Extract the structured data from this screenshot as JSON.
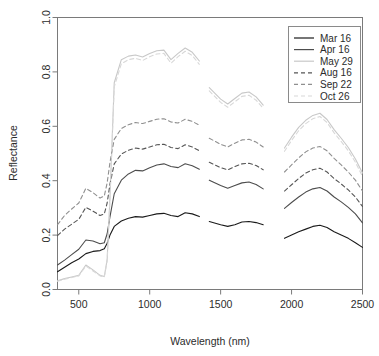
{
  "chart_data": {
    "type": "line",
    "title": "",
    "xlabel": "Wavelength (nm)",
    "ylabel": "Reflectance",
    "xlim": [
      350,
      2500
    ],
    "ylim": [
      0.0,
      1.0
    ],
    "xticks": [
      500,
      1000,
      1500,
      2000,
      2500
    ],
    "yticks": [
      "0.0",
      "0.2",
      "0.4",
      "0.6",
      "0.8",
      "1.0"
    ],
    "grid": false,
    "legend_position": "top-right",
    "gaps": [
      [
        1350,
        1420
      ],
      [
        1800,
        1950
      ]
    ],
    "series": [
      {
        "name": "Mar 16",
        "color": "#1a1a1a",
        "dash": "none",
        "points": [
          [
            350,
            0.065
          ],
          [
            400,
            0.082
          ],
          [
            450,
            0.098
          ],
          [
            500,
            0.112
          ],
          [
            550,
            0.132
          ],
          [
            600,
            0.14
          ],
          [
            650,
            0.143
          ],
          [
            680,
            0.15
          ],
          [
            700,
            0.17
          ],
          [
            720,
            0.2
          ],
          [
            750,
            0.232
          ],
          [
            800,
            0.252
          ],
          [
            850,
            0.262
          ],
          [
            900,
            0.268
          ],
          [
            950,
            0.266
          ],
          [
            1000,
            0.272
          ],
          [
            1050,
            0.278
          ],
          [
            1100,
            0.28
          ],
          [
            1150,
            0.272
          ],
          [
            1200,
            0.268
          ],
          [
            1250,
            0.282
          ],
          [
            1300,
            0.278
          ],
          [
            1350,
            0.268
          ],
          [
            1420,
            0.25
          ],
          [
            1500,
            0.238
          ],
          [
            1550,
            0.232
          ],
          [
            1600,
            0.238
          ],
          [
            1650,
            0.248
          ],
          [
            1700,
            0.25
          ],
          [
            1750,
            0.246
          ],
          [
            1800,
            0.238
          ],
          [
            1950,
            0.188
          ],
          [
            2000,
            0.2
          ],
          [
            2050,
            0.212
          ],
          [
            2100,
            0.222
          ],
          [
            2150,
            0.232
          ],
          [
            2200,
            0.236
          ],
          [
            2250,
            0.228
          ],
          [
            2300,
            0.212
          ],
          [
            2350,
            0.2
          ],
          [
            2400,
            0.188
          ],
          [
            2450,
            0.172
          ],
          [
            2500,
            0.155
          ]
        ]
      },
      {
        "name": "Apr 16",
        "color": "#4d4d4d",
        "dash": "none",
        "points": [
          [
            350,
            0.09
          ],
          [
            400,
            0.108
          ],
          [
            450,
            0.128
          ],
          [
            500,
            0.148
          ],
          [
            550,
            0.182
          ],
          [
            600,
            0.178
          ],
          [
            650,
            0.168
          ],
          [
            680,
            0.172
          ],
          [
            700,
            0.205
          ],
          [
            720,
            0.268
          ],
          [
            750,
            0.352
          ],
          [
            800,
            0.402
          ],
          [
            850,
            0.425
          ],
          [
            900,
            0.438
          ],
          [
            950,
            0.436
          ],
          [
            1000,
            0.448
          ],
          [
            1050,
            0.458
          ],
          [
            1100,
            0.462
          ],
          [
            1150,
            0.452
          ],
          [
            1200,
            0.448
          ],
          [
            1250,
            0.462
          ],
          [
            1300,
            0.455
          ],
          [
            1350,
            0.442
          ],
          [
            1420,
            0.402
          ],
          [
            1500,
            0.382
          ],
          [
            1550,
            0.372
          ],
          [
            1600,
            0.382
          ],
          [
            1650,
            0.392
          ],
          [
            1700,
            0.395
          ],
          [
            1750,
            0.386
          ],
          [
            1800,
            0.37
          ],
          [
            1950,
            0.298
          ],
          [
            2000,
            0.32
          ],
          [
            2050,
            0.34
          ],
          [
            2100,
            0.358
          ],
          [
            2150,
            0.37
          ],
          [
            2200,
            0.375
          ],
          [
            2250,
            0.362
          ],
          [
            2300,
            0.34
          ],
          [
            2350,
            0.322
          ],
          [
            2400,
            0.302
          ],
          [
            2450,
            0.278
          ],
          [
            2500,
            0.245
          ]
        ]
      },
      {
        "name": "May 29",
        "color": "#c8c8c8",
        "dash": "none",
        "points": [
          [
            350,
            0.032
          ],
          [
            400,
            0.04
          ],
          [
            450,
            0.046
          ],
          [
            500,
            0.052
          ],
          [
            550,
            0.09
          ],
          [
            600,
            0.072
          ],
          [
            650,
            0.052
          ],
          [
            680,
            0.048
          ],
          [
            700,
            0.11
          ],
          [
            720,
            0.34
          ],
          [
            750,
            0.76
          ],
          [
            800,
            0.845
          ],
          [
            850,
            0.858
          ],
          [
            900,
            0.862
          ],
          [
            950,
            0.855
          ],
          [
            1000,
            0.868
          ],
          [
            1050,
            0.878
          ],
          [
            1100,
            0.88
          ],
          [
            1150,
            0.845
          ],
          [
            1200,
            0.868
          ],
          [
            1250,
            0.888
          ],
          [
            1300,
            0.872
          ],
          [
            1350,
            0.84
          ],
          [
            1420,
            0.742
          ],
          [
            1500,
            0.7
          ],
          [
            1550,
            0.682
          ],
          [
            1600,
            0.702
          ],
          [
            1650,
            0.722
          ],
          [
            1700,
            0.726
          ],
          [
            1750,
            0.708
          ],
          [
            1800,
            0.678
          ],
          [
            1950,
            0.52
          ],
          [
            2000,
            0.56
          ],
          [
            2050,
            0.596
          ],
          [
            2100,
            0.622
          ],
          [
            2150,
            0.64
          ],
          [
            2200,
            0.648
          ],
          [
            2250,
            0.625
          ],
          [
            2300,
            0.588
          ],
          [
            2350,
            0.556
          ],
          [
            2400,
            0.522
          ],
          [
            2450,
            0.48
          ],
          [
            2500,
            0.428
          ]
        ]
      },
      {
        "name": "Aug 16",
        "color": "#555555",
        "dash": "4,3",
        "points": [
          [
            350,
            0.198
          ],
          [
            400,
            0.222
          ],
          [
            450,
            0.24
          ],
          [
            500,
            0.258
          ],
          [
            550,
            0.302
          ],
          [
            600,
            0.288
          ],
          [
            650,
            0.272
          ],
          [
            680,
            0.278
          ],
          [
            700,
            0.318
          ],
          [
            720,
            0.388
          ],
          [
            750,
            0.462
          ],
          [
            800,
            0.498
          ],
          [
            850,
            0.512
          ],
          [
            900,
            0.52
          ],
          [
            950,
            0.516
          ],
          [
            1000,
            0.524
          ],
          [
            1050,
            0.532
          ],
          [
            1100,
            0.534
          ],
          [
            1150,
            0.522
          ],
          [
            1200,
            0.518
          ],
          [
            1250,
            0.532
          ],
          [
            1300,
            0.524
          ],
          [
            1350,
            0.51
          ],
          [
            1420,
            0.468
          ],
          [
            1500,
            0.448
          ],
          [
            1550,
            0.44
          ],
          [
            1600,
            0.452
          ],
          [
            1650,
            0.462
          ],
          [
            1700,
            0.464
          ],
          [
            1750,
            0.456
          ],
          [
            1800,
            0.44
          ],
          [
            1950,
            0.362
          ],
          [
            2000,
            0.385
          ],
          [
            2050,
            0.408
          ],
          [
            2100,
            0.428
          ],
          [
            2150,
            0.44
          ],
          [
            2200,
            0.446
          ],
          [
            2250,
            0.432
          ],
          [
            2300,
            0.408
          ],
          [
            2350,
            0.388
          ],
          [
            2400,
            0.366
          ],
          [
            2450,
            0.34
          ],
          [
            2500,
            0.305
          ]
        ]
      },
      {
        "name": "Sep 22",
        "color": "#8f8f8f",
        "dash": "4,3",
        "points": [
          [
            350,
            0.238
          ],
          [
            400,
            0.272
          ],
          [
            450,
            0.296
          ],
          [
            500,
            0.318
          ],
          [
            550,
            0.372
          ],
          [
            600,
            0.356
          ],
          [
            650,
            0.336
          ],
          [
            680,
            0.344
          ],
          [
            700,
            0.392
          ],
          [
            720,
            0.468
          ],
          [
            750,
            0.552
          ],
          [
            800,
            0.592
          ],
          [
            850,
            0.606
          ],
          [
            900,
            0.614
          ],
          [
            950,
            0.61
          ],
          [
            1000,
            0.618
          ],
          [
            1050,
            0.626
          ],
          [
            1100,
            0.628
          ],
          [
            1150,
            0.616
          ],
          [
            1200,
            0.612
          ],
          [
            1250,
            0.626
          ],
          [
            1300,
            0.618
          ],
          [
            1350,
            0.604
          ],
          [
            1420,
            0.556
          ],
          [
            1500,
            0.534
          ],
          [
            1550,
            0.524
          ],
          [
            1600,
            0.538
          ],
          [
            1650,
            0.55
          ],
          [
            1700,
            0.552
          ],
          [
            1750,
            0.542
          ],
          [
            1800,
            0.524
          ],
          [
            1950,
            0.432
          ],
          [
            2000,
            0.458
          ],
          [
            2050,
            0.484
          ],
          [
            2100,
            0.506
          ],
          [
            2150,
            0.52
          ],
          [
            2200,
            0.526
          ],
          [
            2250,
            0.51
          ],
          [
            2300,
            0.482
          ],
          [
            2350,
            0.458
          ],
          [
            2400,
            0.432
          ],
          [
            2450,
            0.402
          ],
          [
            2500,
            0.362
          ]
        ]
      },
      {
        "name": "Oct 26",
        "color": "#d8d8d8",
        "dash": "4,3",
        "points": [
          [
            350,
            0.03
          ],
          [
            400,
            0.038
          ],
          [
            450,
            0.044
          ],
          [
            500,
            0.05
          ],
          [
            550,
            0.086
          ],
          [
            600,
            0.068
          ],
          [
            650,
            0.05
          ],
          [
            680,
            0.046
          ],
          [
            700,
            0.105
          ],
          [
            720,
            0.33
          ],
          [
            750,
            0.745
          ],
          [
            800,
            0.83
          ],
          [
            850,
            0.845
          ],
          [
            900,
            0.85
          ],
          [
            950,
            0.842
          ],
          [
            1000,
            0.856
          ],
          [
            1050,
            0.866
          ],
          [
            1100,
            0.868
          ],
          [
            1150,
            0.832
          ],
          [
            1200,
            0.856
          ],
          [
            1250,
            0.876
          ],
          [
            1300,
            0.86
          ],
          [
            1350,
            0.828
          ],
          [
            1420,
            0.73
          ],
          [
            1500,
            0.688
          ],
          [
            1550,
            0.67
          ],
          [
            1600,
            0.69
          ],
          [
            1650,
            0.71
          ],
          [
            1700,
            0.714
          ],
          [
            1750,
            0.696
          ],
          [
            1800,
            0.666
          ],
          [
            1950,
            0.508
          ],
          [
            2000,
            0.548
          ],
          [
            2050,
            0.584
          ],
          [
            2100,
            0.61
          ],
          [
            2150,
            0.628
          ],
          [
            2200,
            0.636
          ],
          [
            2250,
            0.614
          ],
          [
            2300,
            0.576
          ],
          [
            2350,
            0.544
          ],
          [
            2400,
            0.51
          ],
          [
            2450,
            0.468
          ],
          [
            2500,
            0.416
          ]
        ]
      }
    ]
  },
  "legend": {
    "entries": [
      {
        "label": "Mar 16"
      },
      {
        "label": "Apr 16"
      },
      {
        "label": "May 29"
      },
      {
        "label": "Aug 16"
      },
      {
        "label": "Sep 22"
      },
      {
        "label": "Oct 26"
      }
    ]
  },
  "axes": {
    "x_title": "Wavelength (nm)",
    "y_title": "Reflectance",
    "x_tick_labels": [
      "500",
      "1000",
      "1500",
      "2000",
      "2500"
    ],
    "y_tick_labels": [
      "0.0",
      "0.2",
      "0.4",
      "0.6",
      "0.8",
      "1.0"
    ]
  }
}
